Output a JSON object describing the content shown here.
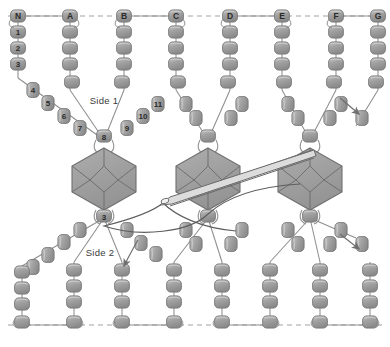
{
  "diagram": {
    "background_color": "#ffffff",
    "bead_fill": "#9a9a9a",
    "bead_fill_light": "#b8b8b8",
    "bead_stroke": "#6e6e6e",
    "rosette_fill": "#9d9d9d",
    "rosette_stroke": "#6a6a6a",
    "thread_color": "#8c8c8c",
    "dashed_color": "#9b9b9b",
    "label_color": "#2b2b2b"
  },
  "labels": {
    "side_one": "Side 1",
    "side_two": "Side 2"
  },
  "anchor_row_top": {
    "y": 16,
    "beads": [
      {
        "label": "N",
        "x": 18
      },
      {
        "label": "A",
        "x": 70
      },
      {
        "label": "B",
        "x": 124
      },
      {
        "label": "C",
        "x": 176
      },
      {
        "label": "D",
        "x": 230
      },
      {
        "label": "E",
        "x": 282
      },
      {
        "label": "F",
        "x": 336
      },
      {
        "label": "G",
        "x": 378
      }
    ]
  },
  "anchor_row_bottom": {
    "y": 325,
    "beads": [
      {
        "label": "",
        "x": 22
      },
      {
        "label": "",
        "x": 74
      },
      {
        "label": "",
        "x": 122
      },
      {
        "label": "",
        "x": 174
      },
      {
        "label": "",
        "x": 222
      },
      {
        "label": "",
        "x": 270
      },
      {
        "label": "",
        "x": 320
      },
      {
        "label": "",
        "x": 370
      }
    ]
  },
  "numbered_beads": {
    "column_left": [
      "1",
      "2",
      "3"
    ],
    "diagonal_down": [
      "4",
      "5",
      "6",
      "7"
    ],
    "vertex": "8",
    "diagonal_up": [
      "9",
      "10",
      "11"
    ],
    "lower_vertex": "3"
  },
  "rosettes": [
    {
      "name": "rosette-left",
      "cx": 104,
      "cy": 177
    },
    {
      "name": "rosette-center",
      "cx": 208,
      "cy": 177
    },
    {
      "name": "rosette-right",
      "cx": 310,
      "cy": 177
    }
  ],
  "arrows": [
    {
      "name": "thread-arrow-upper-right",
      "x": 352,
      "y": 108,
      "angle": 40
    },
    {
      "name": "thread-arrow-lower-right",
      "x": 352,
      "y": 243,
      "angle": 40
    },
    {
      "name": "thread-arrow-side-two",
      "x": 124,
      "y": 262,
      "angle": 118
    }
  ],
  "needle": {
    "name": "beading-needle",
    "tip_x": 163,
    "tip_y": 203
  }
}
